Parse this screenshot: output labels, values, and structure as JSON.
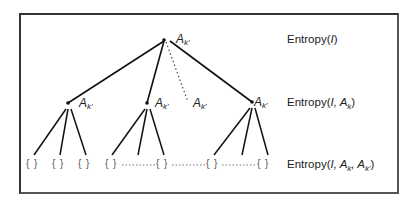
{
  "diagram": {
    "type": "tree",
    "node_label": "A",
    "node_label_sub": "k'",
    "leaf_symbol": "{ }",
    "levels": [
      {
        "label_prefix": "Entropy(",
        "label_italic": "I",
        "label_suffix": ")"
      },
      {
        "label_prefix": "Entropy(",
        "label_italic": "I",
        "label_suffix": ", A",
        "label_sub": "k",
        "label_end": ")"
      },
      {
        "label_prefix": "Entropy(",
        "label_italic": "I",
        "label_suffix": ", A",
        "label_sub": "k",
        "label_mid": ", A",
        "label_sub2": "k'",
        "label_end": ")"
      }
    ],
    "nodes": [
      {
        "id": "root",
        "label": "A",
        "sub": "k'"
      },
      {
        "id": "child-1",
        "label": "A",
        "sub": "k'"
      },
      {
        "id": "child-2",
        "label": "A",
        "sub": "k'"
      },
      {
        "id": "child-dotted",
        "label": "A",
        "sub": "k'"
      },
      {
        "id": "child-3",
        "label": "A",
        "sub": "k'"
      }
    ],
    "leaves": [
      "{ }",
      "{ }",
      "{ }",
      "{ }",
      "{ }",
      "{ }",
      "{ }"
    ],
    "colors": {
      "line": "#111111",
      "frame": "#333333",
      "text": "#222222"
    }
  }
}
